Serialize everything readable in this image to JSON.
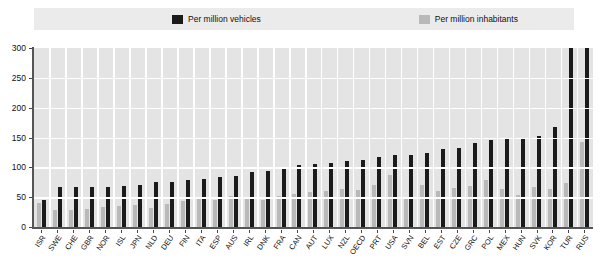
{
  "legend": {
    "items": [
      {
        "key": "vehicles",
        "label": "Per million vehicles",
        "color": "#1b1b1b",
        "icon": "legend-swatch-icon"
      },
      {
        "key": "inhabitants",
        "label": "Per million inhabitants",
        "color": "#b9b9b9",
        "icon": "legend-swatch-icon"
      }
    ]
  },
  "chart_data": {
    "type": "bar",
    "title": "",
    "subtitle": "",
    "xlabel": "",
    "ylabel": "",
    "ylim": [
      0,
      300
    ],
    "yticks": [
      0,
      50,
      100,
      150,
      200,
      250,
      300
    ],
    "grid": true,
    "legend_position": "top",
    "categories": [
      "ISR",
      "SWE",
      "CHE",
      "GBR",
      "NOR",
      "ISL",
      "JPN",
      "NLD",
      "DEU",
      "FIN",
      "ITA",
      "ESP",
      "AUS",
      "IRL",
      "DNK",
      "FRA",
      "CAN",
      "AUT",
      "LUX",
      "NZL",
      "OECD",
      "PRT",
      "USA",
      "SVN",
      "BEL",
      "EST",
      "CZE",
      "GRC",
      "POL",
      "MEX",
      "HUN",
      "SVK",
      "KOR",
      "TUR",
      "RUS"
    ],
    "series": [
      {
        "name": "Per million vehicles",
        "color": "#1b1b1b",
        "values": [
          45,
          67,
          67,
          67,
          67,
          68,
          71,
          75,
          75,
          79,
          81,
          83,
          86,
          92,
          94,
          101,
          104,
          106,
          108,
          110,
          113,
          118,
          120,
          121,
          124,
          130,
          133,
          140,
          145,
          147,
          150,
          152,
          168,
          510,
          730
        ]
      },
      {
        "name": "Per million inhabitants",
        "color": "#b9b9b9",
        "values": [
          40,
          29,
          28,
          30,
          33,
          35,
          37,
          32,
          38,
          44,
          50,
          46,
          52,
          48,
          46,
          52,
          55,
          58,
          60,
          63,
          62,
          70,
          88,
          47,
          70,
          60,
          65,
          69,
          78,
          63,
          54,
          67,
          64,
          73,
          142
        ]
      }
    ],
    "annotations": [
      {
        "category": "TUR",
        "text": "510",
        "series": "Per million vehicles"
      },
      {
        "category": "RUS",
        "text": "730",
        "series": "Per million vehicles"
      }
    ]
  }
}
